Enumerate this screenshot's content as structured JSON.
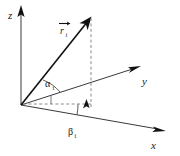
{
  "figure": {
    "background_color": "#ffffff",
    "line_color": "#3a3a3a",
    "vector_color": "#111111",
    "dashed_color": "#8a8a8a"
  },
  "axes": {
    "z": {
      "label": "z",
      "name": "z-axis",
      "origin": [
        21,
        105
      ],
      "tip": [
        21,
        6
      ],
      "label_pos": [
        8,
        16
      ]
    },
    "y": {
      "label": "y",
      "name": "y-axis",
      "origin": [
        21,
        105
      ],
      "tip": [
        141,
        66
      ],
      "label_pos": [
        143,
        82
      ]
    },
    "x": {
      "label": "x",
      "name": "x-axis",
      "origin": [
        21,
        105
      ],
      "tip": [
        166,
        131
      ],
      "label_pos": [
        152,
        146
      ]
    }
  },
  "vector": {
    "label_base": "r",
    "label_subscript": "i",
    "label_accent": "vector-arrow",
    "name": "position-vector-r-i",
    "origin": [
      21,
      105
    ],
    "tip": [
      91,
      17
    ],
    "label_pos": [
      62,
      31
    ]
  },
  "angles": {
    "alpha": {
      "label": "α",
      "subscript": "i",
      "name": "angle-alpha-i",
      "description": "angle between vector and y-axis projection",
      "label_pos": [
        48,
        85
      ]
    },
    "beta": {
      "label": "β",
      "subscript": "i",
      "name": "angle-beta-i",
      "description": "angle between x-axis and horizontal projection",
      "label_pos": [
        71,
        133
      ]
    }
  },
  "projections": {
    "vertical_dashed": {
      "name": "vertical-projection-line",
      "from": [
        91,
        17
      ],
      "to": [
        91,
        107
      ]
    },
    "horizontal_dashed": {
      "name": "horizontal-projection-line",
      "from": [
        21,
        104
      ],
      "to": [
        91,
        104
      ]
    },
    "right_angle_mark": {
      "name": "right-angle-marker",
      "pos": [
        84,
        98
      ]
    }
  }
}
